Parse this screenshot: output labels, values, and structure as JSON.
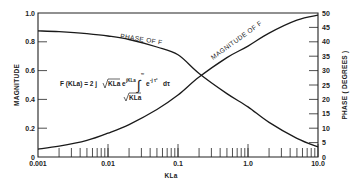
{
  "chart_data": {
    "type": "line",
    "title": "",
    "xlabel": "KLa",
    "ylabel_left": "MAGNITUDE",
    "ylabel_right": "PHASE ( DEGREES )",
    "x_scale": "log",
    "xlim": [
      0.001,
      10.0
    ],
    "ylim_left": [
      0,
      1.0
    ],
    "ylim_right": [
      0,
      50
    ],
    "x_ticks": [
      "0.001",
      "0.01",
      "0.1",
      "1.0",
      "10.0"
    ],
    "y_ticks_left": [
      "0",
      "0.2",
      "0.4",
      "0.6",
      "0.8",
      "1.0"
    ],
    "y_ticks_right": [
      "0",
      "5",
      "10",
      "15",
      "20",
      "25",
      "30",
      "35",
      "40",
      "45",
      "50"
    ],
    "grid": false,
    "formula": "F(KLa) = 2 j √KLa e^{jKLa} ∫_{√KLa}^{∞} e^{-jτ²} dτ",
    "series": [
      {
        "name": "MAGNITUDE OF F",
        "axis": "left",
        "x": [
          0.001,
          0.002,
          0.005,
          0.01,
          0.02,
          0.05,
          0.1,
          0.2,
          0.5,
          1.0,
          2.0,
          5.0,
          10.0
        ],
        "values": [
          0.055,
          0.075,
          0.115,
          0.165,
          0.225,
          0.33,
          0.43,
          0.555,
          0.69,
          0.77,
          0.86,
          0.95,
          0.985
        ]
      },
      {
        "name": "PHASE OF F",
        "axis": "right",
        "x": [
          0.001,
          0.002,
          0.005,
          0.01,
          0.02,
          0.05,
          0.1,
          0.2,
          0.5,
          1.0,
          2.0,
          5.0,
          10.0
        ],
        "values": [
          43.8,
          43.5,
          42.8,
          42.0,
          40.8,
          38.2,
          35.5,
          29.0,
          22.0,
          17.4,
          12.0,
          6.5,
          3.5
        ]
      }
    ],
    "annotations": [
      {
        "text": "PHASE OF F",
        "near": "phase-curve"
      },
      {
        "text": "MAGNITUDE OF F",
        "near": "magnitude-curve"
      }
    ]
  },
  "labels": {
    "x_axis": "KLa",
    "y_left": "MAGNITUDE",
    "y_right": "PHASE ( DEGREES )",
    "phase_curve": "PHASE OF F",
    "magnitude_curve": "MAGNITUDE OF F",
    "formula_lhs": "F (KLa) = 2 j",
    "formula_sqrt": "KLa",
    "formula_e": "e",
    "formula_exp": "jKLa",
    "formula_upper": "∞",
    "formula_integrand": "e",
    "formula_integrand_exp": "-j τ²",
    "formula_dtau": "dτ",
    "formula_lower": "KLa"
  }
}
